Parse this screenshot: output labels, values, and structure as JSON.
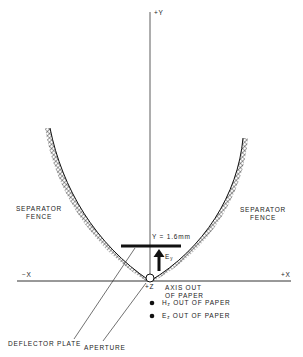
{
  "diagram": {
    "axes": {
      "y_pos_label": "+Y",
      "x_neg_label": "−X",
      "x_pos_label": "+X",
      "z_label": "+Z",
      "z_note_line1": "AXIS OUT",
      "z_note_line2": "OF PAPER"
    },
    "fences": {
      "left_line1": "SEPARATOR",
      "left_line2": "FENCE",
      "right_line1": "SEPARATOR",
      "right_line2": "FENCE"
    },
    "plate": {
      "height_label": "Y = 1.6mm",
      "field_label_main": "E",
      "field_label_sub": "y"
    },
    "legend": [
      {
        "main": "H",
        "sub": "z",
        "text": " OUT OF PAPER"
      },
      {
        "main": "E",
        "sub": "z",
        "text": " OUT OF PAPER"
      }
    ],
    "callouts": {
      "deflector": "DEFLECTOR PLATE",
      "aperture": "APERTURE"
    }
  }
}
